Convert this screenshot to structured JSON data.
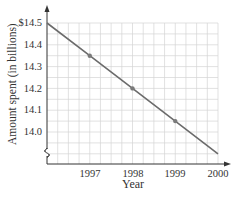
{
  "chart_data": {
    "type": "line",
    "title": "",
    "xlabel": "Year",
    "ylabel": "Amount spent (in billions)",
    "x": [
      1996,
      1997,
      1998,
      1999,
      2000
    ],
    "series": [
      {
        "name": "Amount spent",
        "values": [
          14.5,
          14.35,
          14.2,
          14.05,
          13.9
        ],
        "marked_points": [
          1997,
          1998,
          1999
        ],
        "color": "#6b6b6b"
      }
    ],
    "x_tick_labels": [
      "1997",
      "1998",
      "1999",
      "2000"
    ],
    "y_tick_labels": [
      "$14.5",
      "14.4",
      "14.3",
      "14.2",
      "14.1",
      "14.0"
    ],
    "y_tick_values": [
      14.5,
      14.4,
      14.3,
      14.2,
      14.1,
      14.0
    ],
    "xlim": [
      1996,
      2000
    ],
    "ylim": [
      13.9,
      14.5
    ],
    "y_axis_break": true,
    "grid": true,
    "legend": "none"
  },
  "labels": {
    "xlabel": "Year",
    "ylabel": "Amount spent (in billions)",
    "xticks": [
      "1997",
      "1998",
      "1999",
      "2000"
    ],
    "yticks": [
      "$14.5",
      "14.4",
      "14.3",
      "14.2",
      "14.1",
      "14.0"
    ]
  },
  "colors": {
    "line": "#6b6b6b",
    "grid": "#d4d4d4",
    "axis": "#333333",
    "marker": "#7a7a7a"
  }
}
